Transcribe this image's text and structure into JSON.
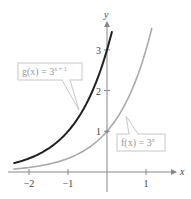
{
  "chart_data": {
    "type": "line",
    "title": "",
    "xlabel": "x",
    "ylabel": "y",
    "xlim": [
      -2.4,
      1.5
    ],
    "ylim": [
      -0.4,
      4.0
    ],
    "grid": false,
    "x_ticks": [
      -2,
      -1,
      1
    ],
    "x_tick_labels": [
      "−2",
      "−1",
      "1"
    ],
    "y_ticks": [
      1,
      2,
      3
    ],
    "y_tick_labels": [
      "1",
      "2",
      "3"
    ],
    "series": [
      {
        "name": "g(x) = 3^(x+1)",
        "color": "#222222",
        "x": [
          -2.4,
          -2.0,
          -1.5,
          -1.0,
          -0.5,
          0.0,
          0.13
        ],
        "values": [
          0.25,
          0.33,
          0.58,
          1.0,
          1.73,
          3.0,
          3.47
        ]
      },
      {
        "name": "f(x) = 3^x",
        "color": "#aaaaaa",
        "x": [
          -2.4,
          -2.0,
          -1.5,
          -1.0,
          -0.5,
          0.0,
          0.5,
          1.0,
          1.15
        ],
        "values": [
          0.07,
          0.11,
          0.19,
          0.33,
          0.58,
          1.0,
          1.73,
          3.0,
          3.54
        ]
      }
    ],
    "annotations": [
      {
        "label_main": "g(x) = 3",
        "label_sup": "x + 1",
        "points_to": "g"
      },
      {
        "label_main": "f(x) = 3",
        "label_sup": "x",
        "points_to": "f"
      }
    ],
    "key_points": [
      {
        "x": 0,
        "y": 1,
        "on": "f"
      },
      {
        "x": 0,
        "y": 3,
        "on": "g"
      }
    ]
  }
}
